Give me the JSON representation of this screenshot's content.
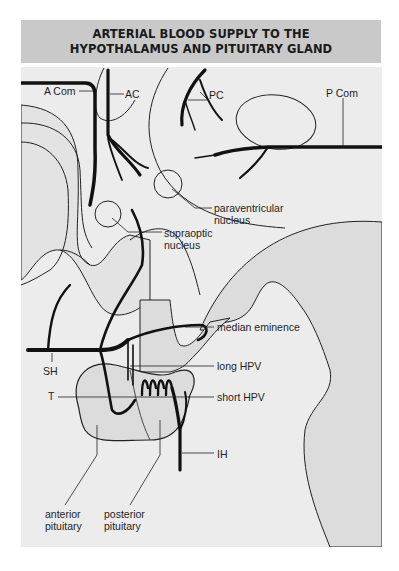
{
  "title": {
    "line1": "ARTERIAL BLOOD SUPPLY TO THE",
    "line2": "HYPOTHALAMUS AND PITUITARY GLAND"
  },
  "labels": {
    "a_com": "A Com",
    "ac": "AC",
    "pc": "PC",
    "p_com": "P Com",
    "paraventricular_1": "paraventricular",
    "paraventricular_2": "nucleus",
    "supraoptic_1": "supraoptic",
    "supraoptic_2": "nucleus",
    "median_eminence": "median eminence",
    "sh": "SH",
    "long_hpv": "long HPV",
    "t": "T",
    "short_hpv": "short HPV",
    "ih": "IH",
    "anterior_1": "anterior",
    "anterior_2": "pituitary",
    "posterior_1": "posterior",
    "posterior_2": "pituitary"
  },
  "colors": {
    "title_band": "#c9c9c9",
    "panel": "#ececec",
    "tissue": "#dcdcdc",
    "vessel": "#111111"
  }
}
